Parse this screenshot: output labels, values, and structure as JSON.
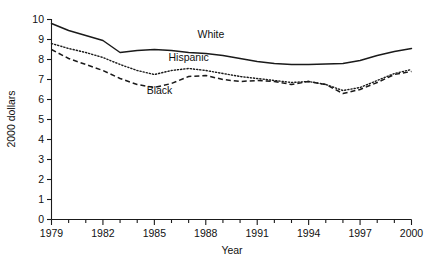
{
  "chart_data": {
    "type": "line",
    "title": "",
    "subtitle": "",
    "xlabel": "Year",
    "ylabel": "2000 dollars",
    "xlim": [
      1979,
      2000
    ],
    "ylim": [
      0,
      10
    ],
    "grid": false,
    "legend_position": "inline-annotations",
    "x_tick_labels": [
      "1979",
      "1982",
      "1985",
      "1988",
      "1991",
      "1994",
      "1997",
      "2000"
    ],
    "x_tick_values": [
      1979,
      1982,
      1985,
      1988,
      1991,
      1994,
      1997,
      2000
    ],
    "x_minor_ticks": [
      1980,
      1981,
      1983,
      1984,
      1986,
      1987,
      1989,
      1990,
      1992,
      1993,
      1995,
      1996,
      1998,
      1999
    ],
    "y_tick_labels": [
      "0",
      "1",
      "2",
      "3",
      "4",
      "5",
      "6",
      "7",
      "8",
      "9",
      "10"
    ],
    "y_tick_values": [
      0,
      1,
      2,
      3,
      4,
      5,
      6,
      7,
      8,
      9,
      10
    ],
    "x": [
      1979,
      1980,
      1981,
      1982,
      1983,
      1984,
      1985,
      1986,
      1987,
      1988,
      1989,
      1990,
      1991,
      1992,
      1993,
      1994,
      1995,
      1996,
      1997,
      1998,
      1999,
      2000
    ],
    "series": [
      {
        "name": "White",
        "style": "solid",
        "color": "#1a1a1a",
        "label_text": "White",
        "values": [
          9.8,
          9.45,
          9.2,
          8.95,
          8.35,
          8.45,
          8.5,
          8.45,
          8.35,
          8.3,
          8.2,
          8.05,
          7.9,
          7.8,
          7.75,
          7.75,
          7.78,
          7.8,
          7.95,
          8.2,
          8.4,
          8.55
        ]
      },
      {
        "name": "Hispanic",
        "style": "dotted",
        "color": "#1a1a1a",
        "label_text": "Hispanic",
        "values": [
          8.8,
          8.55,
          8.35,
          8.1,
          7.75,
          7.45,
          7.25,
          7.45,
          7.55,
          7.45,
          7.3,
          7.15,
          7.05,
          6.95,
          6.85,
          6.9,
          6.75,
          6.45,
          6.6,
          6.95,
          7.3,
          7.5
        ]
      },
      {
        "name": "Black",
        "style": "dashed",
        "color": "#1a1a1a",
        "label_text": "Black",
        "values": [
          8.5,
          8.05,
          7.75,
          7.45,
          7.05,
          6.75,
          6.6,
          6.8,
          7.15,
          7.2,
          7.0,
          6.9,
          6.95,
          6.9,
          6.75,
          6.9,
          6.75,
          6.3,
          6.5,
          6.85,
          7.25,
          7.4
        ]
      }
    ],
    "annotations": [
      {
        "text": "White",
        "x": 1988.3,
        "y": 9.1
      },
      {
        "text": "Hispanic",
        "x": 1987.0,
        "y": 7.95
      },
      {
        "text": "Black",
        "x": 1985.3,
        "y": 6.3
      }
    ]
  }
}
